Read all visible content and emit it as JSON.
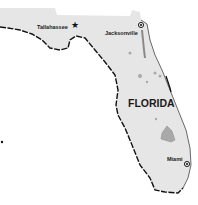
{
  "map": {
    "state_label": "FLORIDA",
    "cities": [
      {
        "name": "Tallahassee",
        "type": "capital",
        "marker": "star-icon"
      },
      {
        "name": "Jacksonville",
        "type": "city",
        "marker": "circle-dot-icon"
      },
      {
        "name": "Miami",
        "type": "city",
        "marker": "circle-dot-icon"
      }
    ],
    "colors": {
      "land": "#e6e6e6",
      "water_body": "#a9a9a9",
      "coastline": "#111111",
      "background": "#ffffff"
    }
  }
}
